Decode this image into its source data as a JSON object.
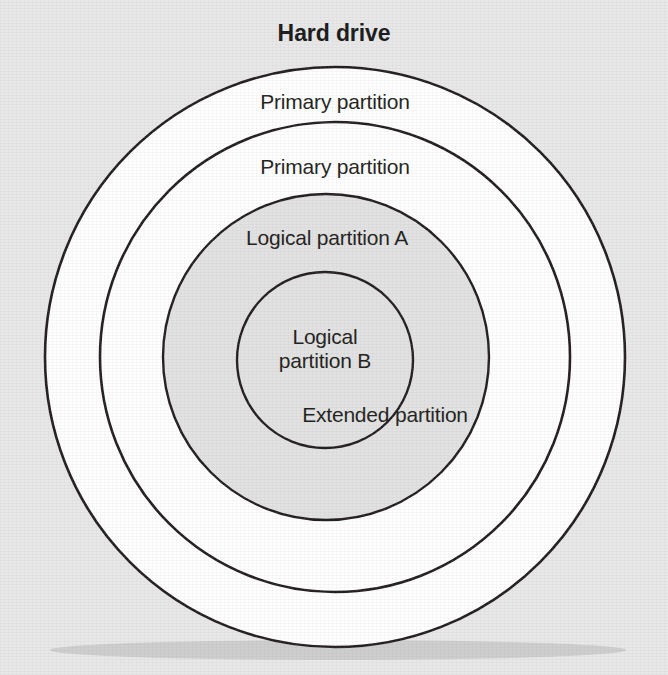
{
  "figure": {
    "title": "Hard drive",
    "type": "concentric-circle-diagram",
    "background_color": "#e8e8e8",
    "stroke_color": "#231f20",
    "labels": {
      "primary_partition_outer": "Primary partition",
      "primary_partition_inner": "Primary partition",
      "logical_partition_a": "Logical partition A",
      "logical_partition_b_line1": "Logical",
      "logical_partition_b_line2": "partition B",
      "extended_partition": "Extended partition"
    },
    "regions": [
      {
        "name": "primary-partition-outer",
        "label": "Primary partition",
        "fill": "#ffffff",
        "center_x": 335,
        "center_y": 357,
        "radius": 290
      },
      {
        "name": "primary-partition-inner",
        "label": "Primary partition",
        "fill": "#ffffff",
        "center_x": 335,
        "center_y": 357,
        "radius": 235
      },
      {
        "name": "logical-partition-a",
        "label": "Logical partition A",
        "fill": "#e2e2e2",
        "center_x": 326,
        "center_y": 357,
        "radius": 163
      },
      {
        "name": "logical-partition-b",
        "label": "Logical partition B",
        "fill": "#e2e2e2",
        "center_x": 325,
        "center_y": 360,
        "radius": 88
      }
    ]
  }
}
